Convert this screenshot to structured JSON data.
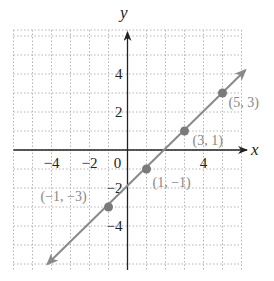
{
  "chart_data": {
    "type": "line",
    "title": "",
    "xlabel": "x",
    "ylabel": "y",
    "xlim": [
      -6,
      6
    ],
    "ylim": [
      -6,
      6
    ],
    "grid": true,
    "grid_style": "dotted",
    "x_ticks": [
      {
        "value": -4,
        "label": "−4"
      },
      {
        "value": -2,
        "label": "−2"
      },
      {
        "value": 0,
        "label": "0"
      },
      {
        "value": 4,
        "label": "4"
      }
    ],
    "y_ticks": [
      {
        "value": 4,
        "label": "4"
      },
      {
        "value": 2,
        "label": "2"
      },
      {
        "value": -2,
        "label": "−2"
      },
      {
        "value": -4,
        "label": "−4"
      }
    ],
    "series": [
      {
        "name": "y = x - 2",
        "line": {
          "x_start": -4,
          "y_start": -6,
          "x_end": 6.2,
          "y_end": 4.2,
          "arrows": "both"
        },
        "points": [
          {
            "x": -1,
            "y": -3,
            "label": "(−1, −3)"
          },
          {
            "x": 1,
            "y": -1,
            "label": "(1, −1)"
          },
          {
            "x": 3,
            "y": 1,
            "label": "(3, 1)"
          },
          {
            "x": 5,
            "y": 3,
            "label": "(5, 3)"
          }
        ]
      }
    ],
    "colors": {
      "line": "#8a8a8a",
      "point": "#7a7a7a",
      "point_label": "#888888",
      "axis": "#222222",
      "grid": "#b5b5b5",
      "tick_label": "#222222"
    }
  }
}
